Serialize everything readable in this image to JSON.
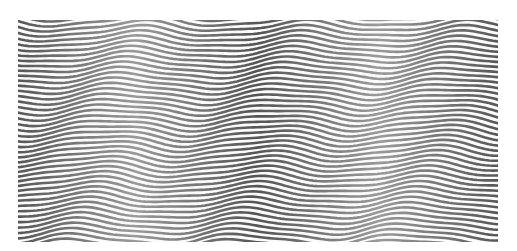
{
  "artwork": {
    "type": "op-art wave stripes",
    "background_color": "#ffffff",
    "canvas_color": "#fbfbfb",
    "stripe_color": "#555555",
    "stripe_highlight": "#9a9a9a",
    "stripe_count": 43,
    "stripe_spacing_px": 5.2,
    "stripe_width_px": 2.6,
    "wave_period_px": 165,
    "wave_amplitude_px": 5,
    "bounds": {
      "x": 18,
      "y": 20,
      "width": 480,
      "height": 222
    }
  }
}
